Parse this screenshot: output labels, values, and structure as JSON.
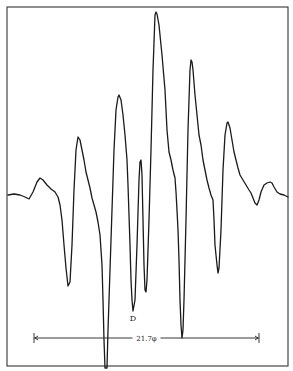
{
  "figure": {
    "frame": {
      "left": 7,
      "top": 7,
      "right": 288,
      "bottom": 366
    },
    "trace_color": "#1a1a1a",
    "peak_label": "D",
    "peak_label_pos": {
      "x": 133,
      "y": 321
    },
    "scale_bar": {
      "label": "21.7φ",
      "x1": 34,
      "x2": 259,
      "y": 338
    },
    "trace_points": [
      [
        8,
        195
      ],
      [
        14,
        194
      ],
      [
        20,
        195
      ],
      [
        25,
        197
      ],
      [
        29,
        199
      ],
      [
        33,
        192
      ],
      [
        37,
        182
      ],
      [
        40,
        178
      ],
      [
        43,
        180
      ],
      [
        47,
        185
      ],
      [
        51,
        189
      ],
      [
        55,
        192
      ],
      [
        58,
        197
      ],
      [
        60,
        205
      ],
      [
        62,
        220
      ],
      [
        64,
        245
      ],
      [
        66,
        268
      ],
      [
        68,
        286
      ],
      [
        70,
        282
      ],
      [
        72,
        245
      ],
      [
        74,
        190
      ],
      [
        76,
        150
      ],
      [
        78,
        137
      ],
      [
        80,
        140
      ],
      [
        82,
        150
      ],
      [
        84,
        160
      ],
      [
        86,
        172
      ],
      [
        88,
        180
      ],
      [
        90,
        188
      ],
      [
        92,
        198
      ],
      [
        94,
        205
      ],
      [
        96,
        212
      ],
      [
        98,
        222
      ],
      [
        100,
        235
      ],
      [
        102,
        265
      ],
      [
        103,
        300
      ],
      [
        104,
        340
      ],
      [
        105,
        368
      ],
      [
        107,
        368
      ],
      [
        108,
        330
      ],
      [
        110,
        270
      ],
      [
        112,
        210
      ],
      [
        114,
        150
      ],
      [
        116,
        110
      ],
      [
        118,
        97
      ],
      [
        119,
        95
      ],
      [
        121,
        100
      ],
      [
        123,
        115
      ],
      [
        125,
        135
      ],
      [
        127,
        160
      ],
      [
        128,
        185
      ],
      [
        129,
        215
      ],
      [
        130,
        245
      ],
      [
        131,
        280
      ],
      [
        132,
        300
      ],
      [
        133,
        311
      ],
      [
        135,
        300
      ],
      [
        137,
        245
      ],
      [
        139,
        180
      ],
      [
        140,
        162
      ],
      [
        141,
        160
      ],
      [
        142,
        175
      ],
      [
        143,
        220
      ],
      [
        144,
        265
      ],
      [
        145,
        290
      ],
      [
        146,
        292
      ],
      [
        147,
        280
      ],
      [
        149,
        220
      ],
      [
        151,
        150
      ],
      [
        153,
        70
      ],
      [
        155,
        15
      ],
      [
        156,
        12
      ],
      [
        157,
        14
      ],
      [
        159,
        25
      ],
      [
        162,
        55
      ],
      [
        165,
        90
      ],
      [
        167,
        130
      ],
      [
        169,
        152
      ],
      [
        171,
        160
      ],
      [
        173,
        170
      ],
      [
        175,
        178
      ],
      [
        176,
        192
      ],
      [
        177,
        210
      ],
      [
        178,
        230
      ],
      [
        179,
        260
      ],
      [
        180,
        300
      ],
      [
        181,
        325
      ],
      [
        182,
        338
      ],
      [
        183,
        330
      ],
      [
        184,
        300
      ],
      [
        186,
        220
      ],
      [
        188,
        130
      ],
      [
        190,
        70
      ],
      [
        191,
        60
      ],
      [
        192,
        62
      ],
      [
        193,
        70
      ],
      [
        195,
        95
      ],
      [
        197,
        115
      ],
      [
        199,
        135
      ],
      [
        201,
        145
      ],
      [
        203,
        160
      ],
      [
        205,
        170
      ],
      [
        207,
        180
      ],
      [
        209,
        188
      ],
      [
        211,
        195
      ],
      [
        213,
        200
      ],
      [
        214,
        220
      ],
      [
        215,
        245
      ],
      [
        217,
        265
      ],
      [
        218,
        273
      ],
      [
        219,
        268
      ],
      [
        221,
        230
      ],
      [
        223,
        170
      ],
      [
        225,
        135
      ],
      [
        227,
        123
      ],
      [
        228,
        122
      ],
      [
        230,
        128
      ],
      [
        232,
        140
      ],
      [
        234,
        152
      ],
      [
        236,
        160
      ],
      [
        238,
        168
      ],
      [
        240,
        175
      ],
      [
        243,
        180
      ],
      [
        246,
        185
      ],
      [
        249,
        190
      ],
      [
        251,
        193
      ],
      [
        253,
        198
      ],
      [
        255,
        203
      ],
      [
        257,
        205
      ],
      [
        259,
        200
      ],
      [
        261,
        192
      ],
      [
        264,
        185
      ],
      [
        267,
        183
      ],
      [
        270,
        182
      ],
      [
        272,
        183
      ],
      [
        274,
        187
      ],
      [
        277,
        192
      ],
      [
        280,
        194
      ],
      [
        284,
        195
      ],
      [
        288,
        197
      ]
    ]
  }
}
